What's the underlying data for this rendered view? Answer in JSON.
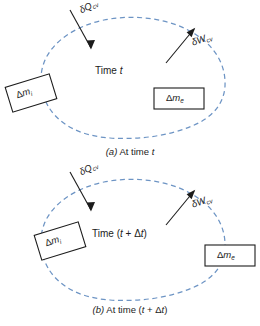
{
  "figure": {
    "background_color": "#ffffff",
    "boundary_color": "#6d94c4",
    "line_color": "#1c1c1c",
    "panels": [
      {
        "id": "panel-a",
        "caption_prefix": "(a)",
        "caption_text": "At time t",
        "caption_full": "(a) At time t",
        "time_label": "Time t",
        "time_label_plain": "Time t",
        "heat": {
          "symbol": "δQ",
          "subscript": "cv",
          "full": "δQcv",
          "direction": "into-control-volume"
        },
        "work": {
          "symbol": "δW",
          "subscript": "cv",
          "full": "δWcv",
          "direction": "out-of-control-volume"
        },
        "inlet_mass": {
          "symbol": "Δm",
          "subscript": "i",
          "full": "Δmi",
          "position": "outside-left",
          "rotated": true
        },
        "exit_mass": {
          "symbol": "Δm",
          "subscript": "e",
          "full": "Δme",
          "position": "inside-right",
          "rotated": false
        }
      },
      {
        "id": "panel-b",
        "caption_prefix": "(b)",
        "caption_text": "At time (t + Δt)",
        "caption_full": "(b) At time (t + Δt)",
        "time_label": "Time (t + Δt)",
        "time_label_plain": "Time (t + Δt)",
        "heat": {
          "symbol": "δQ",
          "subscript": "cv",
          "full": "δQcv",
          "direction": "into-control-volume"
        },
        "work": {
          "symbol": "δW",
          "subscript": "cv",
          "full": "δWcv",
          "direction": "out-of-control-volume"
        },
        "inlet_mass": {
          "symbol": "Δm",
          "subscript": "i",
          "full": "Δmi",
          "position": "inside-left",
          "rotated": true
        },
        "exit_mass": {
          "symbol": "Δm",
          "subscript": "e",
          "full": "Δme",
          "position": "outside-right",
          "rotated": false
        }
      }
    ]
  }
}
